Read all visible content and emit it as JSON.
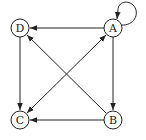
{
  "diagram": {
    "type": "directed-graph",
    "nodes": [
      {
        "id": "A",
        "label": "A",
        "x": 113,
        "y": 28
      },
      {
        "id": "B",
        "label": "B",
        "x": 113,
        "y": 120
      },
      {
        "id": "C",
        "label": "C",
        "x": 20,
        "y": 120
      },
      {
        "id": "D",
        "label": "D",
        "x": 20,
        "y": 28
      }
    ],
    "edges": [
      {
        "from": "A",
        "to": "A",
        "kind": "self-loop"
      },
      {
        "from": "A",
        "to": "D"
      },
      {
        "from": "A",
        "to": "B"
      },
      {
        "from": "A",
        "to": "C",
        "bidirectional": true
      },
      {
        "from": "B",
        "to": "D"
      },
      {
        "from": "B",
        "to": "C"
      },
      {
        "from": "D",
        "to": "C"
      }
    ],
    "colors": {
      "stroke": "#222222",
      "background": "#ffffff"
    }
  }
}
